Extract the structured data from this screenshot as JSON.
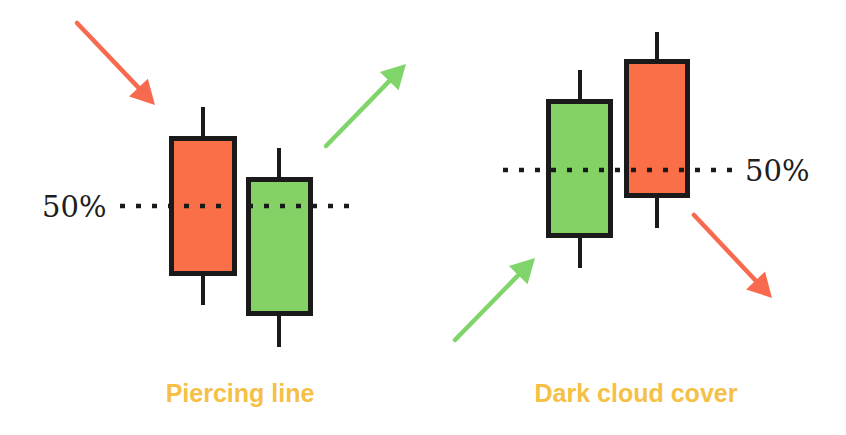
{
  "colors": {
    "bearish": "#fa6e48",
    "bullish": "#84d265",
    "outline": "#1a1a1a",
    "caption": "#f5c045",
    "bearish_arrow": "#f86a4f",
    "bullish_arrow": "#7fd46a",
    "background": "#ffffff"
  },
  "patterns": [
    {
      "name": "Piercing line",
      "midpoint_label": "50%",
      "midpoint_line": {
        "x1": 120,
        "x2": 358,
        "y": 206
      },
      "label_pos": {
        "x": 42,
        "y": 217,
        "anchor": "start"
      },
      "caption_pos": {
        "x": 240,
        "y": 402
      },
      "candles": [
        {
          "type": "bearish",
          "body": {
            "x": 169,
            "y": 136,
            "w": 68,
            "h": 140
          },
          "wick": {
            "x": 203,
            "top": 107,
            "bottom": 305
          }
        },
        {
          "type": "bullish",
          "body": {
            "x": 246,
            "y": 177,
            "w": 67,
            "h": 139
          },
          "wick": {
            "x": 279,
            "top": 148,
            "bottom": 347
          }
        }
      ],
      "arrows": [
        {
          "trend": "down",
          "color_key": "bearish_arrow",
          "from": [
            77,
            23
          ],
          "to": [
            155,
            105
          ]
        },
        {
          "trend": "up",
          "color_key": "bullish_arrow",
          "from": [
            326,
            146
          ],
          "to": [
            406,
            64
          ]
        }
      ]
    },
    {
      "name": "Dark cloud cover",
      "midpoint_label": "50%",
      "midpoint_line": {
        "x1": 503,
        "x2": 740,
        "y": 170
      },
      "label_pos": {
        "x": 745,
        "y": 181,
        "anchor": "start"
      },
      "caption_pos": {
        "x": 636,
        "y": 402
      },
      "candles": [
        {
          "type": "bullish",
          "body": {
            "x": 546,
            "y": 99,
            "w": 67,
            "h": 139
          },
          "wick": {
            "x": 580,
            "top": 70,
            "bottom": 268
          }
        },
        {
          "type": "bearish",
          "body": {
            "x": 624,
            "y": 59,
            "w": 66,
            "h": 139
          },
          "wick": {
            "x": 657,
            "top": 32,
            "bottom": 228
          }
        }
      ],
      "arrows": [
        {
          "trend": "up",
          "color_key": "bullish_arrow",
          "from": [
            455,
            340
          ],
          "to": [
            535,
            258
          ]
        },
        {
          "trend": "down",
          "color_key": "bearish_arrow",
          "from": [
            694,
            215
          ],
          "to": [
            772,
            298
          ]
        }
      ]
    }
  ]
}
